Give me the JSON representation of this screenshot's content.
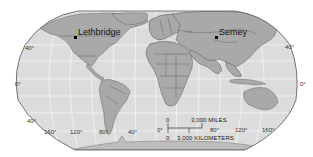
{
  "map": {
    "projection": "world-robinson",
    "colors": {
      "ocean": "#dcdcdc",
      "land": "#a9a9a9",
      "land_dark": "#8f8f8f",
      "border": "#555555",
      "graticule": "#f4f4f4",
      "outline": "#555555",
      "background": "#ffffff"
    },
    "cities": [
      {
        "name": "Lethbridge",
        "x": 75,
        "y": 37
      },
      {
        "name": "Semey",
        "x": 216,
        "y": 37
      }
    ],
    "latitude_labels": {
      "left_north_40": "40°",
      "left_equator": "0°",
      "left_south_40": "40°",
      "right_north_40": "40°",
      "right_equator": "0°"
    },
    "longitude_labels": [
      "160°",
      "120°",
      "80°",
      "40°",
      "0°",
      "80°",
      "120°",
      "160°"
    ],
    "scale_bar": {
      "miles_zero": "0",
      "miles_label": "3,000 MILES",
      "km_zero": "0",
      "km_label": "3,000 KILOMETERS"
    }
  }
}
